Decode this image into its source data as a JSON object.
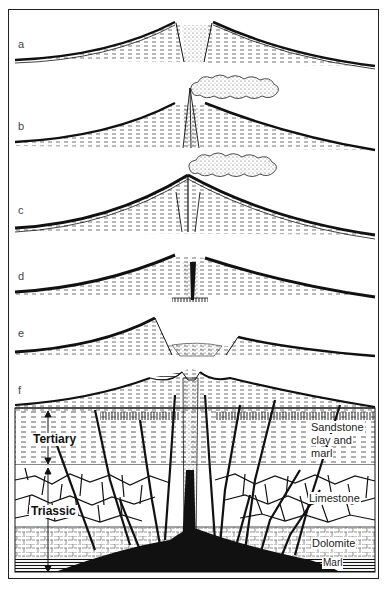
{
  "figure": {
    "panels": [
      {
        "id": "a",
        "label": "a"
      },
      {
        "id": "b",
        "label": "b"
      },
      {
        "id": "c",
        "label": "c"
      },
      {
        "id": "d",
        "label": "d"
      },
      {
        "id": "e",
        "label": "e"
      },
      {
        "id": "f",
        "label": "f"
      }
    ],
    "strata_labels": {
      "sandstone": [
        "Sandstone",
        "clay and",
        "marl"
      ],
      "limestone": "Limestone",
      "dolomite": "Dolomite",
      "marl": "Marl"
    },
    "period_labels": {
      "tertiary": "Tertiary",
      "triassic": "Triassic"
    },
    "colors": {
      "ink": "#111111",
      "paper": "#ffffff",
      "frame": "#222222"
    }
  }
}
